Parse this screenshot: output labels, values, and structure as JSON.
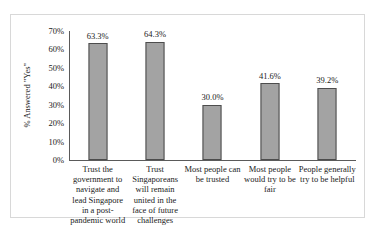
{
  "chart_data": {
    "type": "bar",
    "title": "",
    "xlabel": "",
    "ylabel": "% Answered \"Yes\"",
    "ylim": [
      0,
      70
    ],
    "grid": false,
    "legend": null,
    "categories": [
      "Trust the government to navigate and lead Singapore in a post-pandemic world",
      "Trust Singaporeans will remain united in the face of future challenges",
      "Most people can be trusted",
      "Most people would try to be fair",
      "People generally try to be helpful"
    ],
    "values": [
      63.3,
      64.3,
      30.0,
      41.6,
      39.2
    ],
    "value_labels": [
      "63.3%",
      "64.3%",
      "30.0%",
      "41.6%",
      "39.2%"
    ],
    "yticks": [
      0,
      10,
      20,
      30,
      40,
      50,
      60,
      70
    ],
    "ytick_labels": [
      "0%",
      "10%",
      "20%",
      "30%",
      "40%",
      "50%",
      "60%",
      "70%"
    ],
    "bar_color": "#a3a3a3",
    "bar_edge_color": "#4d4d4d",
    "axis_color": "#5a5a5a",
    "frame_color": "#d8d8d8"
  }
}
